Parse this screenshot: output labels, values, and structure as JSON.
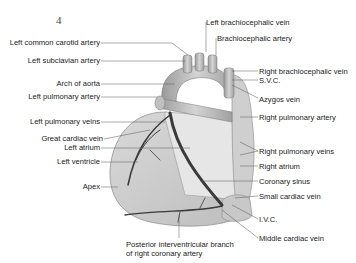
{
  "figure": {
    "number": "4",
    "labels_left": [
      {
        "id": "left-common-carotid-artery",
        "text": "Left common carotid artery"
      },
      {
        "id": "left-subclavian-artery",
        "text": "Left subclavian artery"
      },
      {
        "id": "arch-of-aorta",
        "text": "Arch of aorta"
      },
      {
        "id": "left-pulmonary-artery",
        "text": "Left pulmonary artery"
      },
      {
        "id": "left-pulmonary-veins",
        "text": "Left pulmonary veins"
      },
      {
        "id": "great-cardiac-vein",
        "text": "Great cardiac vein"
      },
      {
        "id": "left-atrium",
        "text": "Left atrium"
      },
      {
        "id": "left-ventricle",
        "text": "Left ventricle"
      },
      {
        "id": "apex",
        "text": "Apex"
      }
    ],
    "labels_top": [
      {
        "id": "left-brachiocephalic-vein",
        "text": "Left brachiocephalic vein"
      },
      {
        "id": "brachiocephalic-artery",
        "text": "Brachiocephalic artery"
      }
    ],
    "labels_right": [
      {
        "id": "right-brachiocephalic-vein",
        "text": "Right brachiocephalic vein"
      },
      {
        "id": "svc",
        "text": "S.V.C."
      },
      {
        "id": "azygos-vein",
        "text": "Azygos vein"
      },
      {
        "id": "right-pulmonary-artery",
        "text": "Right pulmonary artery"
      },
      {
        "id": "right-pulmonary-veins",
        "text": "Right pulmonary veins"
      },
      {
        "id": "right-atrium",
        "text": "Right atrium"
      },
      {
        "id": "coronary-sinus",
        "text": "Coronary sinus"
      },
      {
        "id": "small-cardiac-vein",
        "text": "Small cardiac vein"
      },
      {
        "id": "ivc",
        "text": "I.V.C."
      },
      {
        "id": "middle-cardiac-vein",
        "text": "Middle cardiac vein"
      }
    ],
    "labels_bottom": [
      {
        "id": "posterior-interventricular-branch",
        "line1": "Posterior interventricular branch",
        "line2": "of right coronary artery"
      }
    ]
  }
}
